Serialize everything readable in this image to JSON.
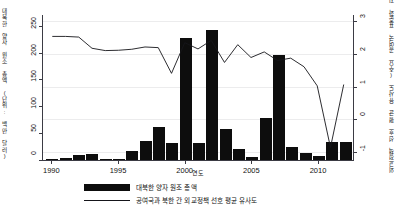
{
  "chart_data": {
    "type": "bar",
    "title": "",
    "xlabel": "연도",
    "ylabel_left": "대북한 양자 원조 총액 (단위: 백만 달러)",
    "ylabel_right": "외교정책 선호 평균 유사도 (주요 공여국 표준화 지수)",
    "grid": true,
    "legend_position": "bottom-left",
    "x": [
      1990,
      1991,
      1992,
      1993,
      1994,
      1995,
      1996,
      1997,
      1998,
      1999,
      2000,
      2001,
      2002,
      2003,
      2004,
      2005,
      2006,
      2007,
      2008,
      2009,
      2010,
      2011,
      2012
    ],
    "xlim": [
      1989.3,
      2012.7
    ],
    "xticks": [
      "1990",
      "1995",
      "2000",
      "2005",
      "2010"
    ],
    "xtick_values": [
      1990,
      1995,
      2000,
      2005,
      2010
    ],
    "ylim_left": [
      0,
      270
    ],
    "yticks_left": [
      "0",
      "50",
      "100",
      "150",
      "200",
      "250"
    ],
    "ytick_values_left": [
      0,
      50,
      100,
      150,
      200,
      250
    ],
    "ylim_right": [
      -1.23,
      3.17
    ],
    "yticks_right": [
      "-1",
      "0",
      "1",
      "2",
      "3"
    ],
    "ytick_values_right": [
      -1,
      0,
      1,
      2,
      3
    ],
    "series": [
      {
        "name": "대북한 양자 원조 총액",
        "type": "bar",
        "axis": "left",
        "color": "#0d0d0d",
        "values": [
          2,
          3,
          9,
          11,
          2,
          1,
          17,
          35,
          61,
          31,
          228,
          31,
          243,
          57,
          20,
          6,
          79,
          196,
          25,
          13,
          7,
          33,
          33
        ]
      },
      {
        "name": "공여국과 북한 간 외교정책 선호 평균 유사도",
        "type": "line",
        "axis": "right",
        "color": "#15151a",
        "values": [
          2.52,
          2.52,
          2.5,
          2.16,
          2.09,
          2.1,
          2.13,
          2.2,
          2.18,
          1.4,
          2.33,
          2.14,
          2.4,
          1.73,
          2.27,
          1.88,
          2.05,
          1.79,
          1.86,
          1.6,
          1.02,
          -0.85,
          1.06
        ]
      }
    ],
    "legend": [
      {
        "label": "대북한 양자 원조 총액",
        "marker": "bar"
      },
      {
        "label": "공여국과 북한 간 외교정책 선호 평균 유사도",
        "marker": "line"
      }
    ]
  }
}
